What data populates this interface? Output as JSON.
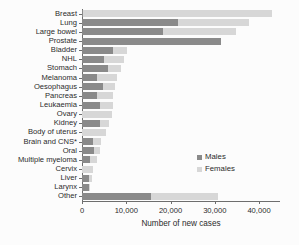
{
  "chart_data": {
    "type": "bar",
    "orientation": "horizontal",
    "stacked": true,
    "title": "",
    "xlabel": "Number of new cases",
    "ylabel": "",
    "xlim": [
      0,
      45000
    ],
    "grid": false,
    "legend_position": "middle-right",
    "xticks": [
      0,
      10000,
      20000,
      30000,
      40000
    ],
    "xticklabels": [
      "0",
      "10,000",
      "20,000",
      "30,000",
      "40,000"
    ],
    "categories": [
      "Breast",
      "Lung",
      "Large bowel",
      "Prostate",
      "Bladder",
      "NHL",
      "Stomach",
      "Melanoma",
      "Oesophagus",
      "Pancreas",
      "Leukaemia",
      "Ovary",
      "Kidney",
      "Body of uterus",
      "Brain and CNS*",
      "Oral",
      "Multiple myeloma",
      "Cervix",
      "Liver",
      "Larynx",
      "Other"
    ],
    "series": [
      {
        "name": "Males",
        "color": "#8a8a8a",
        "values": [
          300,
          21700,
          18200,
          31500,
          7000,
          5000,
          5900,
          3500,
          4800,
          3400,
          4000,
          0,
          4000,
          0,
          2400,
          2700,
          1800,
          0,
          1500,
          1500,
          15500
        ]
      },
      {
        "name": "Females",
        "color": "#d7d7d7",
        "values": [
          42600,
          16100,
          16500,
          0,
          3100,
          4600,
          3000,
          4500,
          2700,
          3700,
          2900,
          6700,
          2200,
          5500,
          1800,
          1300,
          1500,
          2500,
          800,
          400,
          15200
        ]
      }
    ],
    "totals": [
      42900,
      37800,
      34700,
      31500,
      10100,
      9600,
      8900,
      8000,
      7500,
      7100,
      6900,
      6700,
      6200,
      5500,
      4200,
      4000,
      3300,
      2500,
      2300,
      1900,
      30700
    ]
  },
  "legend": {
    "items": [
      {
        "label": "Males",
        "color": "#8a8a8a"
      },
      {
        "label": "Females",
        "color": "#d7d7d7"
      }
    ]
  },
  "colors": {
    "males": "#8a8a8a",
    "females": "#d7d7d7",
    "axis": "#6e6e6e",
    "text": "#2b2b2b",
    "background": "#fcfcfc"
  }
}
